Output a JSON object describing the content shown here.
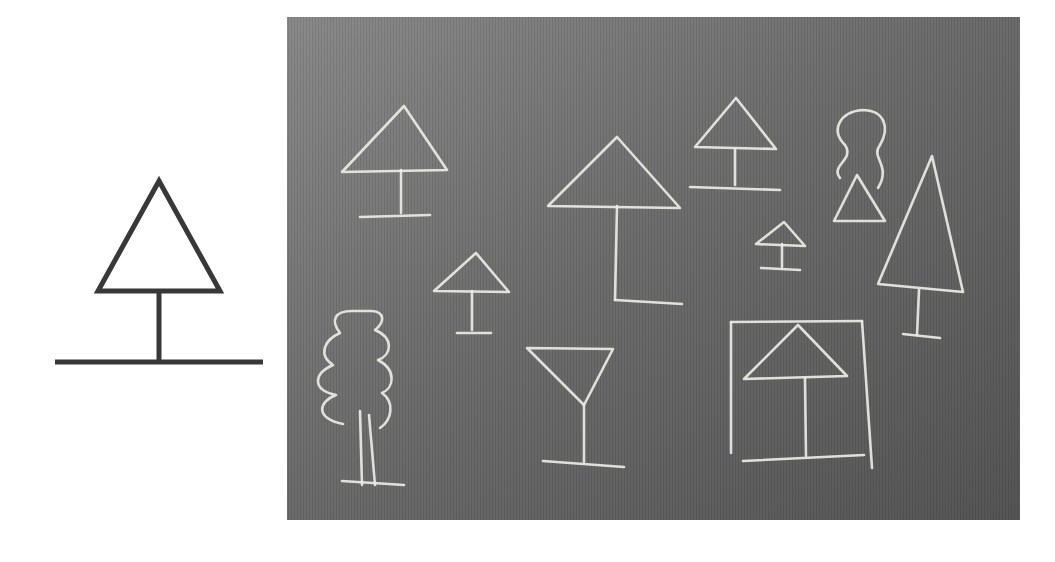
{
  "figure": {
    "background": "#ffffff",
    "reference_symbol": {
      "name": "tree-symbol",
      "stroke": "#383838",
      "triangle": [
        [
          159,
          181
        ],
        [
          98,
          291
        ],
        [
          220,
          291
        ]
      ],
      "trunk": [
        [
          159,
          291
        ],
        [
          159,
          362
        ]
      ],
      "ground": [
        [
          55,
          362
        ],
        [
          263,
          362
        ]
      ]
    },
    "chalkboard": {
      "x": 287,
      "y": 17,
      "width": 733,
      "height": 503,
      "color_light": "#8a8a8a",
      "color_mid": "#6e6e6e",
      "color_dark": "#555555",
      "chalk_color": "#ecece6",
      "drawings": [
        {
          "name": "umbrella-tree-1",
          "paths": [
            "M342,172 L404,106 L447,170 Z",
            "M401,170 L401,213",
            "M360,217 L430,215"
          ]
        },
        {
          "name": "umbrella-tree-large",
          "paths": [
            "M548,206 L617,137 L680,208 Z",
            "M617,206 L615,300",
            "M615,300 L682,304"
          ]
        },
        {
          "name": "umbrella-tree-2",
          "paths": [
            "M695,147 L736,98 L776,149 Z",
            "M735,149 L735,185",
            "M690,187 L780,190"
          ]
        },
        {
          "name": "cloud-tree-top",
          "paths": [
            "M840,178 C830,165 855,160 845,145 C830,130 840,112 862,110 C885,110 890,128 880,145 C870,158 892,165 878,188"
          ]
        },
        {
          "name": "small-triangle",
          "paths": [
            "M834,221 L857,175 L885,221 Z"
          ]
        },
        {
          "name": "tall-conifer",
          "paths": [
            "M878,284 L932,156 L963,292 Z",
            "M919,290 L917,335",
            "M903,334 L940,338"
          ]
        },
        {
          "name": "small-umbrella-tree",
          "paths": [
            "M756,244 L784,222 L805,246 Z",
            "M782,244 L782,267",
            "M761,268 L800,270"
          ]
        },
        {
          "name": "umbrella-tree-3",
          "paths": [
            "M434,291 L476,253 L509,292 Z",
            "M472,291 L472,330",
            "M457,333 L491,333"
          ]
        },
        {
          "name": "wavy-tree",
          "paths": [
            "M343,424 C315,418 318,402 336,395 C312,390 313,374 333,365 C318,355 324,340 340,333 C330,320 335,311 352,311 L372,311 C385,312 385,322 375,330 C394,338 392,355 378,360 C397,370 394,388 382,393 C395,402 392,420 380,428",
            "M360,411 L362,485",
            "M369,415 L375,485",
            "M342,481 L404,485"
          ]
        },
        {
          "name": "martini-glass-tree",
          "paths": [
            "M527,348 L613,349 L584,405 Z",
            "M584,405 L584,462",
            "M543,461 L624,467"
          ]
        },
        {
          "name": "framed-umbrella-tree",
          "paths": [
            "M731,322 L862,321",
            "M731,322 L731,453",
            "M862,321 L872,468",
            "M743,461 L864,455",
            "M744,379 L798,325 L847,376 Z",
            "M805,378 L806,456"
          ]
        }
      ]
    }
  }
}
